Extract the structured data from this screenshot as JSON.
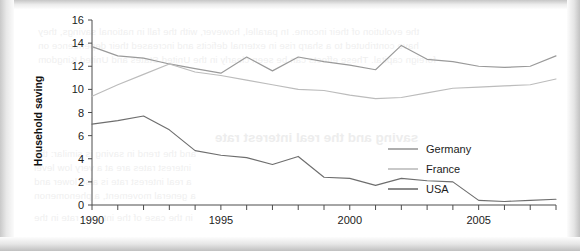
{
  "page": {
    "background_color": "#ffffff",
    "ghost_text": [
      {
        "text": "the evolution of their income. In parallel, however, with the fall in national savings, they",
        "x": 38,
        "y": 26,
        "style": "line"
      },
      {
        "text": "have contributed to a sharp rise in external deficits and increased their dependence on",
        "x": 38,
        "y": 40,
        "style": "line"
      },
      {
        "text": "foreign capital. These effects can be seen clearly in the United States and United Kingdom",
        "x": 38,
        "y": 54,
        "style": "line"
      },
      {
        "text": "saving and the real interest rate",
        "x": 215,
        "y": 130,
        "style": "head"
      },
      {
        "text": "and the trend in saving is similar: the",
        "x": 34,
        "y": 148,
        "style": "line"
      },
      {
        "text": "interest rates are at a very low level",
        "x": 34,
        "y": 162,
        "style": "line"
      },
      {
        "text": "a real interest rate is also lower and",
        "x": 34,
        "y": 176,
        "style": "line"
      },
      {
        "text": "a general movement, a phenomenon",
        "x": 34,
        "y": 190,
        "style": "line"
      },
      {
        "text": "in the case of the interest rate in the",
        "x": 34,
        "y": 212,
        "style": "line"
      }
    ]
  },
  "chart_data": {
    "type": "line",
    "title": "",
    "xlabel": "",
    "ylabel": "Household saving",
    "ylim": [
      0,
      16
    ],
    "xlim": [
      1990,
      2008
    ],
    "ytick_step": 2,
    "yticks": [
      "0",
      "2",
      "4",
      "6",
      "8",
      "10",
      "12",
      "14",
      "16"
    ],
    "xticks_all": [
      1990,
      1991,
      1992,
      1993,
      1994,
      1995,
      1996,
      1997,
      1998,
      1999,
      2000,
      2001,
      2002,
      2003,
      2004,
      2005,
      2006,
      2007,
      2008
    ],
    "xtick_labels": [
      {
        "value": 1990,
        "label": "1990"
      },
      {
        "value": 1995,
        "label": "1995"
      },
      {
        "value": 2000,
        "label": "2000"
      },
      {
        "value": 2005,
        "label": "2005"
      }
    ],
    "grid": false,
    "legend_position": "center-right",
    "x": [
      1990,
      1991,
      1992,
      1993,
      1994,
      1995,
      1996,
      1997,
      1998,
      1999,
      2000,
      2001,
      2002,
      2003,
      2004,
      2005,
      2006,
      2007,
      2008
    ],
    "series": [
      {
        "name": "Germany",
        "color": "#9a9a9a",
        "values": [
          13.7,
          12.9,
          12.7,
          12.2,
          11.8,
          11.4,
          12.8,
          11.6,
          12.8,
          12.4,
          12.1,
          11.7,
          13.8,
          12.6,
          12.4,
          12.0,
          11.9,
          12.0,
          12.9
        ]
      },
      {
        "name": "France",
        "color": "#bcbcbc",
        "values": [
          9.4,
          10.4,
          11.3,
          12.2,
          11.5,
          11.2,
          10.8,
          10.4,
          10.0,
          9.9,
          9.5,
          9.2,
          9.3,
          9.7,
          10.1,
          10.2,
          10.3,
          10.4,
          10.9
        ]
      },
      {
        "name": "USA",
        "color": "#6e6e6e",
        "values": [
          7.0,
          7.3,
          7.7,
          6.5,
          4.7,
          4.3,
          4.1,
          3.5,
          4.2,
          2.4,
          2.3,
          1.7,
          2.3,
          2.1,
          2.0,
          0.4,
          0.3,
          0.4,
          0.5
        ]
      }
    ],
    "legend": [
      {
        "label": "Germany",
        "color": "#9a9a9a"
      },
      {
        "label": "France",
        "color": "#bcbcbc"
      },
      {
        "label": "USA",
        "color": "#6e6e6e"
      }
    ]
  }
}
